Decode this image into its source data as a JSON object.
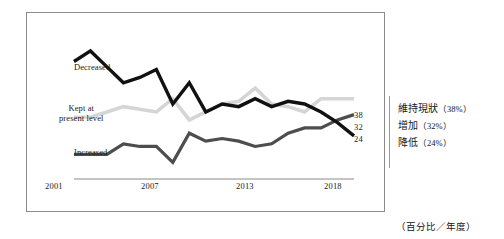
{
  "chart_data": {
    "type": "line",
    "title": "",
    "xlabel": "",
    "ylabel": "",
    "caption": "（百分比／年度）",
    "grid": false,
    "legend_position": "right",
    "x": [
      2001,
      2002,
      2003,
      2004,
      2005,
      2006,
      2007,
      2008,
      2009,
      2010,
      2011,
      2012,
      2013,
      2014,
      2015,
      2016,
      2017,
      2018
    ],
    "xlim": [
      2001,
      2018
    ],
    "ylim": [
      10,
      62
    ],
    "xticks": [
      "2001",
      "2007",
      "2013",
      "2018"
    ],
    "xtick_values": [
      2001,
      2007,
      2013,
      2018
    ],
    "series": [
      {
        "name": "Decreased",
        "color": "#111111",
        "end_value": 24,
        "end_label": "24",
        "values": [
          52,
          56,
          50,
          44,
          46,
          49,
          36,
          44,
          33,
          36,
          35,
          38,
          35,
          37,
          36,
          33,
          29,
          24
        ]
      },
      {
        "name": "Kept at present level",
        "color": "#d5d5d5",
        "end_value": 38,
        "end_label": "38",
        "values": [
          31,
          31,
          33,
          35,
          34,
          33,
          38,
          30,
          33,
          36,
          37,
          42,
          36,
          35,
          33,
          38,
          38,
          38
        ]
      },
      {
        "name": "Increased",
        "color": "#4d4d4d",
        "end_value": 32,
        "end_label": "32",
        "values": [
          17,
          17,
          17,
          21,
          20,
          20,
          14,
          25,
          22,
          23,
          22,
          20,
          21,
          25,
          27,
          27,
          30,
          32
        ]
      }
    ],
    "end_labels": [
      "38",
      "32",
      "24"
    ]
  },
  "series_labels": {
    "decreased": "Decreased",
    "kept_line1": "Kept at",
    "kept_line2": "present level",
    "increased": "Increased"
  },
  "legend": {
    "items": [
      {
        "label": "維持現狀",
        "pct": "（38%）"
      },
      {
        "label": "增加",
        "pct": "（32%）"
      },
      {
        "label": "降低",
        "pct": "（24%）"
      }
    ]
  },
  "footnote": "（百分比／年度）",
  "colors": {
    "decreased": "#111111",
    "kept": "#d5d5d5",
    "increased": "#4d4d4d",
    "axis": "#8a8a8a",
    "frame": "#8a8a8a"
  }
}
